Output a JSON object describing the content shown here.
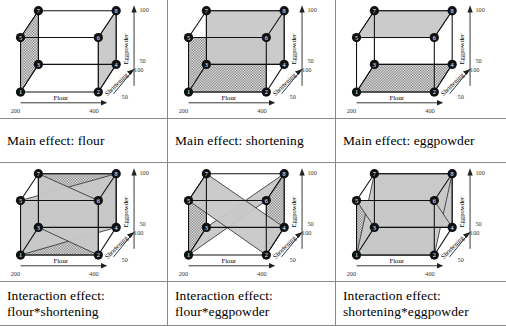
{
  "figure": {
    "title_visible": false,
    "background": "#ffffff",
    "border_color": "#8a8a8a",
    "shade_gray": "#c8c8c8",
    "hatch_color": "#555555",
    "node_fill": "#111111",
    "node_text_color": "#ffffff"
  },
  "axes": {
    "x": {
      "name": "Flour",
      "low": "200",
      "high": "400"
    },
    "y": {
      "name": "Shortening",
      "low": "50",
      "high": "100"
    },
    "z": {
      "name": "Eggpowder",
      "low": "50",
      "high": "100"
    }
  },
  "vertices": [
    {
      "id": "1",
      "label": "1",
      "x": 13,
      "y": 103
    },
    {
      "id": "2",
      "label": "2",
      "x": 100,
      "y": 103
    },
    {
      "id": "3",
      "label": "3",
      "x": 33,
      "y": 72
    },
    {
      "id": "4",
      "label": "4",
      "x": 120,
      "y": 72
    },
    {
      "id": "5",
      "label": "5",
      "x": 13,
      "y": 42
    },
    {
      "id": "6",
      "label": "6",
      "x": 100,
      "y": 42
    },
    {
      "id": "7",
      "label": "7",
      "x": 33,
      "y": 12
    },
    {
      "id": "8",
      "label": "8",
      "x": 120,
      "y": 12
    }
  ],
  "edges": [
    [
      "1",
      "2"
    ],
    [
      "1",
      "3"
    ],
    [
      "1",
      "5"
    ],
    [
      "2",
      "4"
    ],
    [
      "2",
      "6"
    ],
    [
      "3",
      "4"
    ],
    [
      "3",
      "7"
    ],
    [
      "4",
      "8"
    ],
    [
      "5",
      "6"
    ],
    [
      "5",
      "7"
    ],
    [
      "6",
      "8"
    ],
    [
      "7",
      "8"
    ]
  ],
  "hidden_edges": [
    [
      "1",
      "3"
    ],
    [
      "3",
      "4"
    ],
    [
      "3",
      "7"
    ]
  ],
  "chart_data": {
    "type": "diagram",
    "subtype": "cube-plot-grid",
    "rows": 2,
    "cols": 3,
    "factors": [
      "flour",
      "shortening",
      "eggpowder"
    ],
    "factor_levels": {
      "flour": [
        "200",
        "400"
      ],
      "shortening": [
        "50",
        "100"
      ],
      "eggpowder": [
        "50",
        "100"
      ]
    },
    "panels": [
      {
        "index": 0,
        "caption": [
          "Main effect: flour"
        ],
        "effect_type": "main",
        "effect": "flour",
        "faces": [
          {
            "vertices": [
              "1",
              "3",
              "7",
              "5"
            ],
            "fill": "hatch",
            "level": "low"
          },
          {
            "vertices": [
              "2",
              "4",
              "8",
              "6"
            ],
            "fill": "gray",
            "level": "high"
          }
        ]
      },
      {
        "index": 1,
        "caption": [
          "Main effect: shortening"
        ],
        "effect_type": "main",
        "effect": "shortening",
        "faces": [
          {
            "vertices": [
              "1",
              "2",
              "6",
              "5"
            ],
            "fill": "hatch",
            "level": "low"
          },
          {
            "vertices": [
              "3",
              "4",
              "8",
              "7"
            ],
            "fill": "gray",
            "level": "high"
          }
        ]
      },
      {
        "index": 2,
        "caption": [
          "Main effect: eggpowder"
        ],
        "effect_type": "main",
        "effect": "eggpowder",
        "faces": [
          {
            "vertices": [
              "1",
              "2",
              "4",
              "3"
            ],
            "fill": "hatch",
            "level": "low"
          },
          {
            "vertices": [
              "5",
              "6",
              "8",
              "7"
            ],
            "fill": "gray",
            "level": "high"
          }
        ]
      },
      {
        "index": 3,
        "caption": [
          "Interaction effect:",
          "flour*shortening"
        ],
        "effect_type": "interaction",
        "effect": "flour*shortening",
        "faces": [
          {
            "vertices": [
              "3",
              "7",
              "8",
              "4"
            ],
            "fill": "hatch",
            "level": "cross-a"
          },
          {
            "vertices": [
              "1",
              "5",
              "6",
              "2"
            ],
            "fill": "hatch",
            "level": "cross-a2"
          },
          {
            "vertices": [
              "1",
              "5",
              "8",
              "4"
            ],
            "fill": "gray",
            "level": "cross-b"
          },
          {
            "vertices": [
              "3",
              "7",
              "6",
              "2"
            ],
            "fill": "gray",
            "level": "cross-b2"
          }
        ]
      },
      {
        "index": 4,
        "caption": [
          "Interaction effect:",
          "flour*eggpowder"
        ],
        "effect_type": "interaction",
        "effect": "flour*eggpowder",
        "faces": [
          {
            "vertices": [
              "1",
              "3",
              "7",
              "5"
            ],
            "fill": "hatch",
            "level": "cross-a"
          },
          {
            "vertices": [
              "2",
              "4",
              "8",
              "6"
            ],
            "fill": "hatch",
            "level": "cross-a2"
          },
          {
            "vertices": [
              "1",
              "3",
              "8",
              "6"
            ],
            "fill": "gray",
            "level": "cross-b"
          },
          {
            "vertices": [
              "5",
              "7",
              "4",
              "2"
            ],
            "fill": "gray",
            "level": "cross-b2"
          }
        ]
      },
      {
        "index": 5,
        "caption": [
          "Interaction effect:",
          "shortening*eggpowder"
        ],
        "effect_type": "interaction",
        "effect": "shortening*eggpowder",
        "faces": [
          {
            "vertices": [
              "1",
              "2",
              "6",
              "5"
            ],
            "fill": "hatch",
            "level": "cross-a"
          },
          {
            "vertices": [
              "3",
              "4",
              "8",
              "7"
            ],
            "fill": "gray",
            "level": "cross-a2"
          },
          {
            "vertices": [
              "1",
              "2",
              "8",
              "7"
            ],
            "fill": "gray",
            "level": "cross-b"
          },
          {
            "vertices": [
              "3",
              "4",
              "6",
              "5"
            ],
            "fill": "gray",
            "level": "cross-b2"
          }
        ]
      }
    ]
  }
}
